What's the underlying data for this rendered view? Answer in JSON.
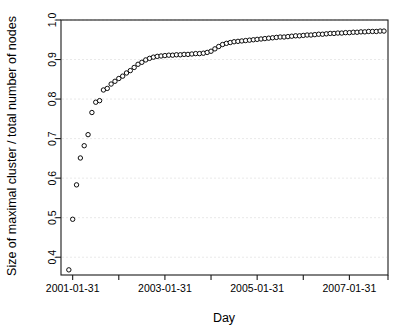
{
  "chart_data": {
    "type": "scatter",
    "title": "",
    "xlabel": "Day",
    "ylabel": "Size of maximal cluster / total number of nodes",
    "grid": "horizontal-dashed",
    "legend": "none",
    "marker": "open-circle",
    "xlim": [
      2000.83,
      2007.92
    ],
    "ylim": [
      0.355,
      1.0
    ],
    "ytick_values": [
      0.4,
      0.5,
      0.6,
      0.7,
      0.8,
      0.9,
      1.0
    ],
    "ytick_labels": [
      "0.4",
      "0.5",
      "0.6",
      "0.7",
      "0.8",
      "0.9",
      "1.0"
    ],
    "xtick_values": [
      2001.083,
      2002.083,
      2003.083,
      2004.083,
      2005.083,
      2006.083,
      2007.083,
      2007.92
    ],
    "xtick_labels": [
      "2001-01-31",
      "",
      "2003-01-31",
      "",
      "2005-01-31",
      "",
      "2007-01-31",
      ""
    ],
    "x_labeled_ticks": [
      {
        "value": 2001.083,
        "label": "2001-01-31"
      },
      {
        "value": 2003.083,
        "label": "2003-01-31"
      },
      {
        "value": 2005.083,
        "label": "2005-01-31"
      },
      {
        "value": 2007.083,
        "label": "2007-01-31"
      }
    ],
    "colors": {
      "marker_stroke": "#000000",
      "marker_fill": "#ffffff",
      "axis": "#1a1a1a",
      "grid": "#e9e9e9",
      "background": "#ffffff"
    },
    "x": [
      2001.0,
      2001.083,
      2001.167,
      2001.25,
      2001.333,
      2001.417,
      2001.5,
      2001.583,
      2001.667,
      2001.75,
      2001.833,
      2001.917,
      2002.0,
      2002.083,
      2002.167,
      2002.25,
      2002.333,
      2002.417,
      2002.5,
      2002.583,
      2002.667,
      2002.75,
      2002.833,
      2002.917,
      2003.0,
      2003.083,
      2003.167,
      2003.25,
      2003.333,
      2003.417,
      2003.5,
      2003.583,
      2003.667,
      2003.75,
      2003.833,
      2003.917,
      2004.0,
      2004.083,
      2004.167,
      2004.25,
      2004.333,
      2004.417,
      2004.5,
      2004.583,
      2004.667,
      2004.75,
      2004.833,
      2004.917,
      2005.0,
      2005.083,
      2005.167,
      2005.25,
      2005.333,
      2005.417,
      2005.5,
      2005.583,
      2005.667,
      2005.75,
      2005.833,
      2005.917,
      2006.0,
      2006.083,
      2006.167,
      2006.25,
      2006.333,
      2006.417,
      2006.5,
      2006.583,
      2006.667,
      2006.75,
      2006.833,
      2006.917,
      2007.0,
      2007.083,
      2007.167,
      2007.25,
      2007.333,
      2007.417,
      2007.5,
      2007.583,
      2007.667,
      2007.75,
      2007.833
    ],
    "y": [
      0.368,
      0.496,
      0.583,
      0.651,
      0.682,
      0.71,
      0.766,
      0.792,
      0.796,
      0.823,
      0.827,
      0.838,
      0.845,
      0.852,
      0.858,
      0.866,
      0.872,
      0.88,
      0.888,
      0.893,
      0.899,
      0.903,
      0.906,
      0.908,
      0.909,
      0.91,
      0.911,
      0.911,
      0.912,
      0.912,
      0.913,
      0.913,
      0.914,
      0.915,
      0.915,
      0.916,
      0.918,
      0.921,
      0.927,
      0.933,
      0.938,
      0.941,
      0.943,
      0.945,
      0.946,
      0.947,
      0.948,
      0.949,
      0.95,
      0.951,
      0.952,
      0.953,
      0.954,
      0.955,
      0.956,
      0.957,
      0.957,
      0.958,
      0.959,
      0.96,
      0.96,
      0.961,
      0.962,
      0.962,
      0.963,
      0.964,
      0.964,
      0.965,
      0.966,
      0.966,
      0.967,
      0.967,
      0.968,
      0.968,
      0.969,
      0.969,
      0.97,
      0.97,
      0.971,
      0.971,
      0.971,
      0.972,
      0.972
    ]
  }
}
